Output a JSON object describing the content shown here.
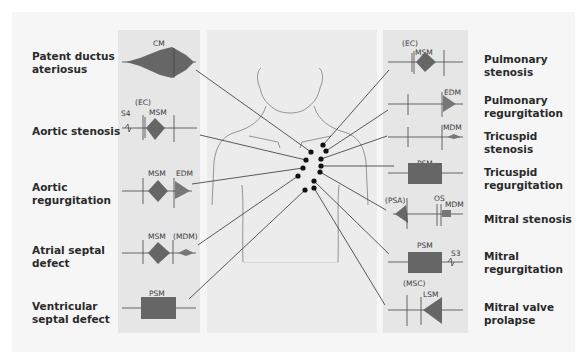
{
  "diagram": {
    "type": "heart-murmur-auscultation-map",
    "left": [
      {
        "condition": "Patent ductus ateriosus",
        "line1": "Patent ductus",
        "line2": "ateriosus",
        "waveform_labels": [
          "CM"
        ]
      },
      {
        "condition": "Aortic stenosis",
        "line1": "Aortic stenosis",
        "line2": "",
        "waveform_labels": [
          "(EC)",
          "S4",
          "MSM"
        ]
      },
      {
        "condition": "Aortic regurgitation",
        "line1": "Aortic",
        "line2": "regurgitation",
        "waveform_labels": [
          "MSM",
          "EDM"
        ]
      },
      {
        "condition": "Atrial septal defect",
        "line1": "Atrial septal",
        "line2": "defect",
        "waveform_labels": [
          "MSM",
          "(MDM)"
        ]
      },
      {
        "condition": "Ventricular septal defect",
        "line1": "Ventricular",
        "line2": "septal defect",
        "waveform_labels": [
          "PSM"
        ]
      }
    ],
    "right": [
      {
        "condition": "Pulmonary stenosis",
        "line1": "Pulmonary",
        "line2": "stenosis",
        "waveform_labels": [
          "(EC)",
          "MSM"
        ]
      },
      {
        "condition": "Pulmonary regurgitation",
        "line1": "Pulmonary",
        "line2": "regurgitation",
        "waveform_labels": [
          "EDM"
        ]
      },
      {
        "condition": "Tricuspid stenosis",
        "line1": "Tricuspid",
        "line2": "stenosis",
        "waveform_labels": [
          "MDM"
        ]
      },
      {
        "condition": "Tricuspid regurgitation",
        "line1": "Tricuspid",
        "line2": "regurgitation",
        "waveform_labels": [
          "PSM"
        ]
      },
      {
        "condition": "Mitral stenosis",
        "line1": "Mitral stenosis",
        "line2": "",
        "waveform_labels": [
          "(PSA)",
          "OS",
          "MDM"
        ]
      },
      {
        "condition": "Mitral regurgitation",
        "line1": "Mitral",
        "line2": "regurgitation",
        "waveform_labels": [
          "PSM",
          "S3"
        ]
      },
      {
        "condition": "Mitral valve prolapse",
        "line1": "Mitral valve",
        "line2": "prolapse",
        "waveform_labels": [
          "(MSC)",
          "LSM"
        ]
      }
    ],
    "colors": {
      "outer_bg": "#f6f6f6",
      "panel_bg": "#e6e6e6",
      "center_bg": "#ececec",
      "line": "#333333",
      "dot": "#111111",
      "text": "#2a2a2a"
    }
  }
}
